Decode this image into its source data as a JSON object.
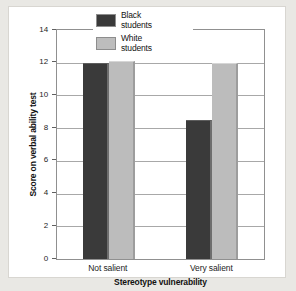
{
  "chart_data": {
    "type": "bar",
    "title": "",
    "xlabel": "Stereotype vulnerability",
    "ylabel": "Score on verbal ability test",
    "categories": [
      "Not salient",
      "Very salient"
    ],
    "series": [
      {
        "name": "Black students",
        "values": [
          12.0,
          8.5
        ],
        "color": "#3a3a3a"
      },
      {
        "name": "White students",
        "values": [
          12.1,
          12.0
        ],
        "color": "#bcbcbc"
      }
    ],
    "ylim": [
      0,
      14
    ],
    "yticks": [
      0,
      2,
      4,
      6,
      8,
      10,
      12,
      14
    ],
    "ytick_labels": [
      "0",
      "2",
      "4",
      "6",
      "8",
      "10",
      "12",
      "14"
    ],
    "grid": "horizontal",
    "legend_position": "upper-center-inside",
    "legend_entries": [
      {
        "label": "Black\nstudents",
        "swatch": "dark"
      },
      {
        "label": "White\nstudents",
        "swatch": "light"
      }
    ]
  },
  "figure": {
    "background_color": "#e9e8e4",
    "card_color": "#ffffff",
    "axis_color": "#909090",
    "grid_color": "#a8a8a8"
  }
}
